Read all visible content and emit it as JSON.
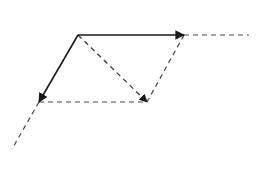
{
  "diagram": {
    "title": "",
    "type": "vector parallelogram addition",
    "colors": {
      "solid": "#1a1a1a",
      "dashed": "#4a4a4a",
      "background": "#ffffff"
    },
    "points": {
      "origin": [
        78,
        35
      ],
      "vector_a_tip": [
        184,
        35
      ],
      "vector_b_tip": [
        39,
        102
      ],
      "resultant_tip": [
        147,
        102
      ],
      "a_extension_end": [
        249,
        35
      ],
      "b_extension_end": [
        12,
        149
      ]
    },
    "vectors": [
      {
        "name": "vector-a",
        "from": "origin",
        "to": "vector_a_tip",
        "style": "solid",
        "arrow": true
      },
      {
        "name": "vector-b",
        "from": "origin",
        "to": "vector_b_tip",
        "style": "solid",
        "arrow": true
      },
      {
        "name": "resultant",
        "from": "origin",
        "to": "resultant_tip",
        "style": "dashed",
        "arrow": true
      }
    ],
    "construction_lines": [
      {
        "name": "parallel-to-a",
        "from": "vector_b_tip",
        "to": "resultant_tip",
        "style": "dashed"
      },
      {
        "name": "parallel-to-b",
        "from": "vector_a_tip",
        "to": "resultant_tip",
        "style": "dashed"
      },
      {
        "name": "a-extension",
        "from": "vector_a_tip",
        "to": "a_extension_end",
        "style": "dashed"
      },
      {
        "name": "b-extension",
        "from": "vector_b_tip",
        "to": "b_extension_end",
        "style": "dashed"
      }
    ]
  }
}
